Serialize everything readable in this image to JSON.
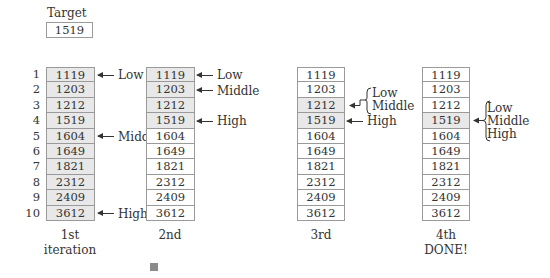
{
  "target": {
    "label": "Target",
    "value": "1519"
  },
  "indices": [
    "1",
    "2",
    "3",
    "4",
    "5",
    "6",
    "7",
    "8",
    "9",
    "10"
  ],
  "values": [
    "1119",
    "1203",
    "1212",
    "1519",
    "1604",
    "1649",
    "1821",
    "2312",
    "2409",
    "3612"
  ],
  "iterations": [
    {
      "caption_line1": "1st",
      "caption_line2": "iteration",
      "shaded_rows": [
        0,
        1,
        2,
        3,
        4,
        5,
        6,
        7,
        8,
        9
      ],
      "pointers": [
        {
          "label": "Low",
          "row": 0
        },
        {
          "label": "Middle",
          "row": 4
        },
        {
          "label": "High",
          "row": 9
        }
      ]
    },
    {
      "caption_line1": "2nd",
      "caption_line2": "",
      "shaded_rows": [
        0,
        1,
        2,
        3
      ],
      "pointers": [
        {
          "label": "Low",
          "row": 0
        },
        {
          "label": "Middle",
          "row": 1
        },
        {
          "label": "High",
          "row": 3
        }
      ]
    },
    {
      "caption_line1": "3rd",
      "caption_line2": "",
      "shaded_rows": [
        2,
        3
      ],
      "brace_labels": [
        "Low",
        "Middle"
      ],
      "brace_row": 2,
      "pointers": [
        {
          "label": "High",
          "row": 3
        }
      ]
    },
    {
      "caption_line1": "4th",
      "caption_line2": "DONE!",
      "shaded_rows": [
        3
      ],
      "brace_labels": [
        "Low",
        "Middle",
        "High"
      ],
      "brace_row": 3
    }
  ],
  "colors": {
    "shaded": "#e8e8e8",
    "border": "#9a9a9a",
    "text": "#333333"
  }
}
